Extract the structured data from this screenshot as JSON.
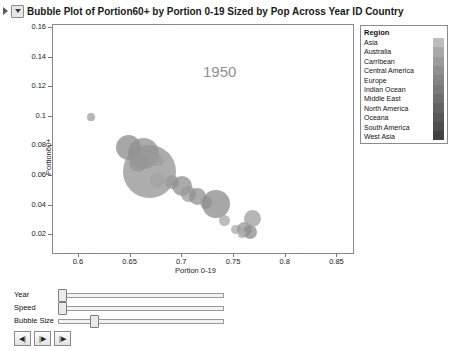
{
  "window": {
    "title": "Bubble Plot of Portion60+ by Portion 0-19 Sized by Pop Across Year ID Country",
    "expander_icon": "triangle-right-icon",
    "menu_icon": "red-triangle-menu-icon"
  },
  "legend": {
    "title": "Region",
    "items": [
      {
        "label": "Asia",
        "color": "#bdbdbd"
      },
      {
        "label": "Australia",
        "color": "#a9a9a9"
      },
      {
        "label": "Carribean",
        "color": "#9b9b9b"
      },
      {
        "label": "Central America",
        "color": "#8f8f8f"
      },
      {
        "label": "Europe",
        "color": "#848484"
      },
      {
        "label": "Indian Ocean",
        "color": "#797979"
      },
      {
        "label": "Middle East",
        "color": "#6e6e6e"
      },
      {
        "label": "North America",
        "color": "#636363"
      },
      {
        "label": "Oceana",
        "color": "#585858"
      },
      {
        "label": "South America",
        "color": "#4d4d4d"
      },
      {
        "label": "West Asia",
        "color": "#414141"
      }
    ]
  },
  "controls": {
    "year_label": "Year",
    "speed_label": "Speed",
    "bubble_size_label": "Bubble Size",
    "year_value": 0,
    "speed_value": 0,
    "bubble_size_value": 20,
    "buttons": [
      {
        "name": "step-back-button",
        "glyph": "◀|"
      },
      {
        "name": "play-button",
        "glyph": "|▶"
      },
      {
        "name": "step-forward-button",
        "glyph": "|▶"
      }
    ]
  },
  "chart_data": {
    "type": "scatter",
    "title": "Bubble Plot of Portion60+ by Portion 0-19 Sized by Pop Across Year ID Country",
    "annotation": "1950",
    "xlabel": "Portion 0-19",
    "ylabel": "Portion60+",
    "xlim": [
      0.575,
      0.865
    ],
    "ylim": [
      0.008,
      0.162
    ],
    "xticks": [
      0.6,
      0.65,
      0.7,
      0.75,
      0.8,
      0.85
    ],
    "yticks": [
      0.02,
      0.04,
      0.06,
      0.08,
      0.1,
      0.12,
      0.14,
      0.16
    ],
    "grid": false,
    "legend_position": "right",
    "size_variable": "Pop",
    "points": [
      {
        "x": 0.612,
        "y": 0.1,
        "size": 5,
        "color": "#9e9e9e"
      },
      {
        "x": 0.648,
        "y": 0.079,
        "size": 16,
        "color": "#8a8a8a"
      },
      {
        "x": 0.662,
        "y": 0.075,
        "size": 20,
        "color": "#8f8f8f"
      },
      {
        "x": 0.657,
        "y": 0.069,
        "size": 12,
        "color": "#a0a0a0"
      },
      {
        "x": 0.668,
        "y": 0.063,
        "size": 34,
        "color": "#939393"
      },
      {
        "x": 0.676,
        "y": 0.071,
        "size": 8,
        "color": "#9b9b9b"
      },
      {
        "x": 0.684,
        "y": 0.073,
        "size": 6,
        "color": "#a8a8a8"
      },
      {
        "x": 0.676,
        "y": 0.057,
        "size": 10,
        "color": "#a3a3a3"
      },
      {
        "x": 0.69,
        "y": 0.056,
        "size": 9,
        "color": "#9a9a9a"
      },
      {
        "x": 0.7,
        "y": 0.053,
        "size": 13,
        "color": "#8d8d8d"
      },
      {
        "x": 0.706,
        "y": 0.048,
        "size": 10,
        "color": "#999999"
      },
      {
        "x": 0.715,
        "y": 0.046,
        "size": 11,
        "color": "#8f8f8f"
      },
      {
        "x": 0.723,
        "y": 0.042,
        "size": 8,
        "color": "#a2a2a2"
      },
      {
        "x": 0.733,
        "y": 0.041,
        "size": 18,
        "color": "#898989"
      },
      {
        "x": 0.741,
        "y": 0.03,
        "size": 7,
        "color": "#a5a5a5"
      },
      {
        "x": 0.752,
        "y": 0.024,
        "size": 6,
        "color": "#aaaaaa"
      },
      {
        "x": 0.76,
        "y": 0.024,
        "size": 10,
        "color": "#969696"
      },
      {
        "x": 0.765,
        "y": 0.022,
        "size": 9,
        "color": "#8c8c8c"
      },
      {
        "x": 0.768,
        "y": 0.031,
        "size": 11,
        "color": "#9d9d9d"
      },
      {
        "x": 0.758,
        "y": 0.021,
        "size": 5,
        "color": "#b0b0b0"
      }
    ]
  }
}
